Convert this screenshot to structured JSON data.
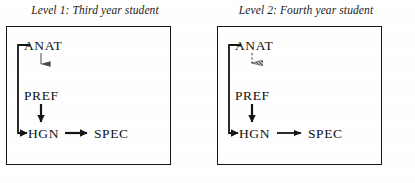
{
  "figure": {
    "type": "diagram",
    "background_color": "#ffffff",
    "ink_color": "#151515",
    "panel_count": 2
  },
  "panels": [
    {
      "id": "level-1",
      "title": "Level 1: Third year student",
      "nodes": [
        {
          "id": "anat",
          "label": "ANAT"
        },
        {
          "id": "pref",
          "label": "PREF"
        },
        {
          "id": "hgn",
          "label": "HGN"
        },
        {
          "id": "spec",
          "label": "SPEC"
        }
      ],
      "edges": [
        {
          "id": "anat-pref",
          "from": "ANAT",
          "to": "PREF",
          "style": "thin-tapered",
          "weight": "light"
        },
        {
          "id": "pref-hgn",
          "from": "PREF",
          "to": "HGN",
          "style": "solid",
          "weight": "heavy"
        },
        {
          "id": "anat-hgn",
          "from": "ANAT",
          "to": "HGN",
          "style": "elbow-solid",
          "weight": "heavy"
        },
        {
          "id": "hgn-spec",
          "from": "HGN",
          "to": "SPEC",
          "style": "solid",
          "weight": "heavy"
        }
      ]
    },
    {
      "id": "level-2",
      "title": "Level 2: Fourth year student",
      "nodes": [
        {
          "id": "anat",
          "label": "ANAT"
        },
        {
          "id": "pref",
          "label": "PREF"
        },
        {
          "id": "hgn",
          "label": "HGN"
        },
        {
          "id": "spec",
          "label": "SPEC"
        }
      ],
      "edges": [
        {
          "id": "anat-pref",
          "from": "ANAT",
          "to": "PREF",
          "style": "dashed-hatched",
          "weight": "light"
        },
        {
          "id": "pref-hgn",
          "from": "PREF",
          "to": "HGN",
          "style": "solid",
          "weight": "heavy"
        },
        {
          "id": "anat-hgn",
          "from": "ANAT",
          "to": "HGN",
          "style": "elbow-solid",
          "weight": "heavy"
        },
        {
          "id": "hgn-spec",
          "from": "HGN",
          "to": "SPEC",
          "style": "solid",
          "weight": "medium"
        }
      ]
    }
  ]
}
